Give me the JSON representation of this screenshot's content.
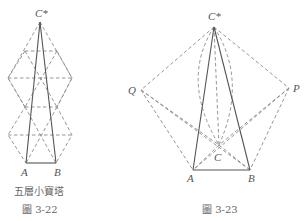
{
  "figures": [
    {
      "id": "fig-3-22",
      "labels": {
        "apex": "C*",
        "a": "A",
        "b": "B"
      },
      "subtitle": "五層小寶塔",
      "caption": "圖 3-22",
      "points": {
        "C_star": [
          40,
          22
        ],
        "A": [
          26,
          163
        ],
        "B": [
          56,
          163
        ]
      }
    },
    {
      "id": "fig-3-23",
      "labels": {
        "apex": "C*",
        "p": "P",
        "q": "Q",
        "c": "C",
        "a": "A",
        "b": "B"
      },
      "caption": "圖 3-23",
      "points": {
        "C_star": [
          214,
          27
        ],
        "Q": [
          141,
          90
        ],
        "P": [
          289,
          88
        ],
        "C": [
          219,
          145
        ],
        "A": [
          193,
          170
        ],
        "B": [
          250,
          170
        ]
      }
    }
  ],
  "colors": {
    "solid": "#555555",
    "dashed": "#8a8a8a",
    "text": "#555555"
  }
}
